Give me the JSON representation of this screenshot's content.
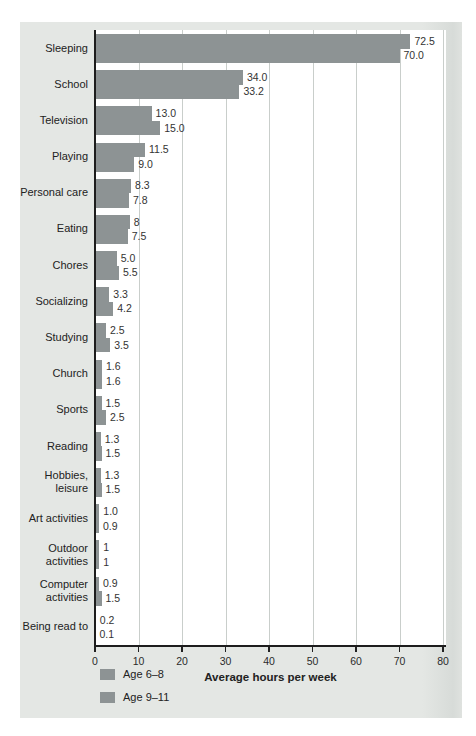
{
  "colors": {
    "page_background": "#ffffff",
    "card_background": "#e4e7e4",
    "bar": "#8d9394",
    "axis": "#1d1d1d",
    "gridline": "#c9cecb",
    "text": "#222222"
  },
  "chart_data": {
    "type": "bar",
    "orientation": "horizontal",
    "title": "",
    "xlabel": "Average hours per week",
    "ylabel": "",
    "xlim": [
      0,
      80
    ],
    "xticks": [
      0,
      10,
      20,
      30,
      40,
      50,
      60,
      70,
      80
    ],
    "xtick_labels": [
      "0",
      "10",
      "20",
      "30",
      "40",
      "50",
      "60",
      "70",
      "80"
    ],
    "grid": true,
    "legend_position": "bottom-left",
    "bar_color": "#8d9394",
    "categories": [
      "Sleeping",
      "School",
      "Television",
      "Playing",
      "Personal care",
      "Eating",
      "Chores",
      "Socializing",
      "Studying",
      "Church",
      "Sports",
      "Reading",
      "Hobbies, leisure",
      "Art activities",
      "Outdoor activities",
      "Computer activities",
      "Being read to"
    ],
    "categories_display": [
      "Sleeping",
      "School",
      "Television",
      "Playing",
      "Personal care",
      "Eating",
      "Chores",
      "Socializing",
      "Studying",
      "Church",
      "Sports",
      "Reading",
      "Hobbies,\nleisure",
      "Art activities",
      "Outdoor\nactivities",
      "Computer\nactivities",
      "Being read to"
    ],
    "series": [
      {
        "name": "Age 6–8",
        "values": [
          72.5,
          34.0,
          13.0,
          11.5,
          8.3,
          8,
          5.0,
          3.3,
          2.5,
          1.6,
          1.5,
          1.3,
          1.3,
          1.0,
          1,
          0.9,
          0.2
        ],
        "value_labels": [
          "72.5",
          "34.0",
          "13.0",
          "11.5",
          "8.3",
          "8",
          "5.0",
          "3.3",
          "2.5",
          "1.6",
          "1.5",
          "1.3",
          "1.3",
          "1.0",
          "1",
          "0.9",
          "0.2"
        ]
      },
      {
        "name": "Age 9–11",
        "values": [
          70.0,
          33.2,
          15.0,
          9.0,
          7.8,
          7.5,
          5.5,
          4.2,
          3.5,
          1.6,
          2.5,
          1.5,
          1.5,
          0.9,
          1,
          1.5,
          0.1
        ],
        "value_labels": [
          "70.0",
          "33.2",
          "15.0",
          "9.0",
          "7.8",
          "7.5",
          "5.5",
          "4.2",
          "3.5",
          "1.6",
          "2.5",
          "1.5",
          "1.5",
          "0.9",
          "1",
          "1.5",
          "0.1"
        ]
      }
    ]
  }
}
